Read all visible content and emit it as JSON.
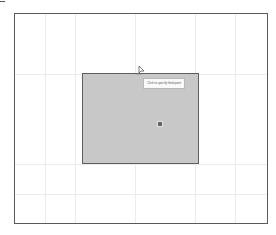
{
  "app": {
    "type": "cad-drawing-canvas"
  },
  "canvas": {
    "frame_color": "#5a5a5a",
    "background": "#ffffff",
    "grid_color": "#ececec"
  },
  "selection": {
    "fill": "#c8c8c8",
    "border": "#5e5e5e"
  },
  "tooltip": {
    "text": "Click to specify third point"
  },
  "snap_marker": {
    "icon": "snap-point-icon",
    "color": "#666666"
  },
  "cursor": {
    "icon": "crosshair-cursor-icon"
  }
}
